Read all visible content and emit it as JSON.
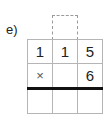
{
  "label": "e)",
  "grid": {
    "rows": [
      [
        "1",
        "1",
        "5"
      ],
      [
        "×",
        "",
        "6"
      ],
      [
        "",
        "",
        ""
      ]
    ]
  }
}
